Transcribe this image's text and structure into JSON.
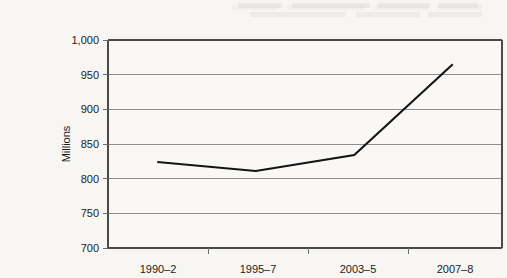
{
  "chart_data": {
    "type": "line",
    "title": "",
    "subtitle": "",
    "xlabel": "",
    "ylabel": "Millions",
    "categories": [
      "1990–2",
      "1995–7",
      "2003–5",
      "2007–8"
    ],
    "values": [
      824,
      811,
      834,
      965
    ],
    "series": [
      {
        "name": "Millions",
        "values": [
          824,
          811,
          834,
          965
        ]
      }
    ],
    "ylim": [
      700,
      1000
    ],
    "y_ticks": [
      700,
      750,
      800,
      850,
      900,
      950,
      1000
    ],
    "y_tick_labels": [
      "700",
      "750",
      "800",
      "850",
      "900",
      "950",
      "1,000"
    ],
    "x_tick_labels": [
      "1990–2",
      "1995–7",
      "2003–5",
      "2007–8"
    ],
    "grid": true,
    "grid_axis": "y",
    "legend": false,
    "legend_position": "none",
    "annotations": [],
    "colors": {
      "series_line": "#141414",
      "gridline": "#8f8f8f",
      "axis": "#4a4a4a",
      "text": "#1b1b1b",
      "background": "#f7f6f3"
    }
  },
  "figure": {
    "y_axis_title": "Millions",
    "y_labels": {
      "t1000": "1,000",
      "t950": "950",
      "t900": "900",
      "t850": "850",
      "t800": "800",
      "t750": "750",
      "t700": "700"
    },
    "x_labels": {
      "c0": "1990–2",
      "c1": "1995–7",
      "c2": "2003–5",
      "c3": "2007–8"
    }
  }
}
